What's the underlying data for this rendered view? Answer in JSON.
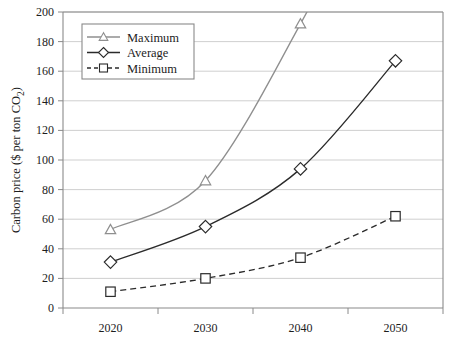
{
  "chart_data": {
    "type": "line",
    "title": "",
    "xlabel": "",
    "ylabel": "Carbon price ($ per ton CO2)",
    "ylabel_parts": {
      "main": "Carbon price ($ per ton CO",
      "sub": "2",
      "tail": ")"
    },
    "categories": [
      "2020",
      "2030",
      "2040",
      "2050"
    ],
    "x": [
      2020,
      2030,
      2040,
      2050
    ],
    "xlim": [
      2015,
      2055
    ],
    "ylim": [
      0,
      200
    ],
    "ytick_step": 20,
    "yticks": [
      "0",
      "20",
      "40",
      "60",
      "80",
      "100",
      "120",
      "140",
      "160",
      "180",
      "200"
    ],
    "ytick_values": [
      0,
      20,
      40,
      60,
      80,
      100,
      120,
      140,
      160,
      180,
      200
    ],
    "grid": true,
    "grid_axis": "y",
    "legend_position": "upper-left-inside",
    "series": [
      {
        "name": "Maximum",
        "values": [
          53,
          86,
          192,
          null
        ],
        "marker": "triangle",
        "color": "#8f8f8f",
        "linestyle": "solid",
        "note": "line continues above top of plot after 2040"
      },
      {
        "name": "Average",
        "values": [
          31,
          55,
          94,
          167
        ],
        "marker": "diamond",
        "color": "#2b2b2b",
        "linestyle": "solid"
      },
      {
        "name": "Minimum",
        "values": [
          11,
          20,
          34,
          62
        ],
        "marker": "square",
        "color": "#2b2b2b",
        "linestyle": "dashed"
      }
    ]
  },
  "legend": {
    "items": [
      {
        "label": "Maximum"
      },
      {
        "label": "Average"
      },
      {
        "label": "Minimum"
      }
    ]
  },
  "colors": {
    "maximum": "#8f8f8f",
    "average": "#2b2b2b",
    "minimum": "#2b2b2b",
    "grid": "#c9c9c9",
    "frame": "#8a8a8a",
    "background": "#ffffff"
  }
}
